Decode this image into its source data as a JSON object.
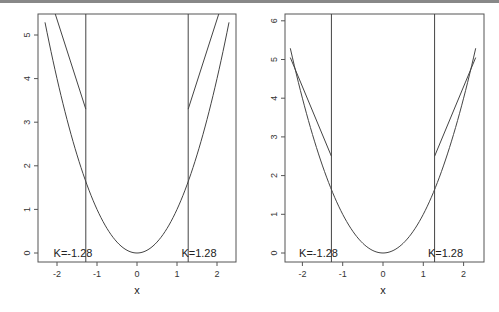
{
  "chart_data": [
    {
      "type": "line",
      "title": "",
      "xlabel": "x",
      "ylabel": "",
      "xlim": [
        -2.35,
        2.6
      ],
      "ylim": [
        -0.2,
        5.5
      ],
      "xticks": [
        -2,
        -1,
        0,
        1,
        2
      ],
      "yticks": [
        0,
        1,
        2,
        3,
        4,
        5
      ],
      "grid": false,
      "vlines": [
        -1.28,
        1.28
      ],
      "annotations": [
        {
          "text": "K=-1.28",
          "x": -1.6,
          "y": 0
        },
        {
          "text": "K=1.28",
          "x": 1.55,
          "y": 0
        }
      ],
      "series": [
        {
          "name": "parabola",
          "x": [
            -2.3,
            -2,
            -1.5,
            -1,
            -0.5,
            0,
            0.5,
            1,
            1.5,
            2,
            2.3
          ],
          "values": [
            5.29,
            4,
            2.25,
            1,
            0.25,
            0,
            0.25,
            1,
            2.25,
            4,
            5.29
          ]
        },
        {
          "name": "upper-left",
          "x": [
            -2.05,
            -1.28
          ],
          "values": [
            5.5,
            3.3
          ]
        },
        {
          "name": "upper-right",
          "x": [
            1.28,
            2.05
          ],
          "values": [
            3.3,
            5.5
          ]
        }
      ]
    },
    {
      "type": "line",
      "title": "",
      "xlabel": "x",
      "ylabel": "",
      "xlim": [
        -2.35,
        2.6
      ],
      "ylim": [
        -0.2,
        6.1
      ],
      "xticks": [
        -2,
        -1,
        0,
        1,
        2
      ],
      "yticks": [
        0,
        1,
        2,
        3,
        4,
        5,
        6
      ],
      "grid": false,
      "vlines": [
        -1.28,
        1.28
      ],
      "annotations": [
        {
          "text": "K=-1.28",
          "x": -1.6,
          "y": 0
        },
        {
          "text": "K=1.28",
          "x": 1.55,
          "y": 0
        }
      ],
      "series": [
        {
          "name": "parabola",
          "x": [
            -2.3,
            -2,
            -1.5,
            -1,
            -0.5,
            0,
            0.5,
            1,
            1.5,
            2,
            2.3
          ],
          "values": [
            5.29,
            4,
            2.25,
            1,
            0.25,
            0,
            0.25,
            1,
            2.25,
            4,
            5.29
          ]
        },
        {
          "name": "upper-left",
          "x": [
            -2.3,
            -1.28
          ],
          "values": [
            5.05,
            2.5
          ]
        },
        {
          "name": "upper-right",
          "x": [
            1.28,
            2.3
          ],
          "values": [
            2.5,
            5.05
          ]
        }
      ]
    }
  ]
}
